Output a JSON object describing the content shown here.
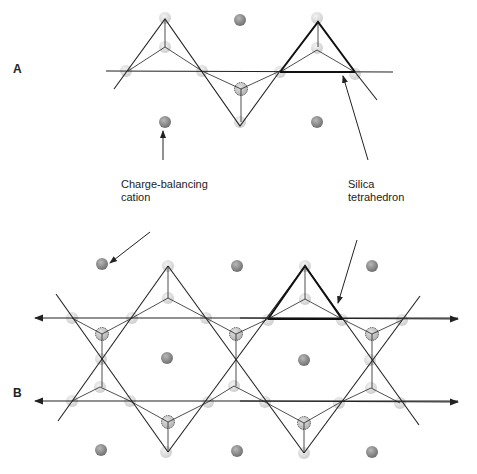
{
  "panels": {
    "a_label": "A",
    "b_label": "B"
  },
  "annotations": {
    "cation_line1": "Charge-balancing",
    "cation_line2": "cation",
    "tetra_line1": "Silica",
    "tetra_line2": "tetrahedron"
  },
  "legend_semantics": {
    "cation_atom": "dark gray sphere",
    "oxygen_atom": "light gray sphere",
    "silicon_atom": "dashed-outline sphere"
  },
  "colors": {
    "line": "#222222",
    "cation": "#8a8a8a",
    "oxygen": "#d8d8d8",
    "silicon": "#c4c4c4"
  }
}
